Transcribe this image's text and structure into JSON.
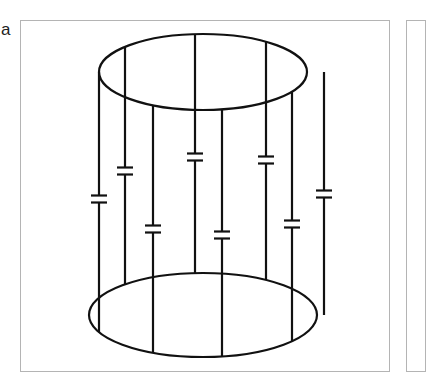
{
  "figure": {
    "panel_label": "a",
    "colors": {
      "stroke": "#111111",
      "frame": "#b4b4b4",
      "background": "#ffffff"
    },
    "top_ring": {
      "cx": 203,
      "cy": 72,
      "rx": 104,
      "ry": 38
    },
    "bottom_ring": {
      "cx": 203,
      "cy": 315,
      "rx": 114,
      "ry": 42
    },
    "rungs": [
      {
        "id": "rung-1",
        "x": 99,
        "capacitor_y": 199
      },
      {
        "id": "rung-2",
        "x": 125,
        "capacitor_y": 171
      },
      {
        "id": "rung-3",
        "x": 153,
        "capacitor_y": 229
      },
      {
        "id": "rung-4",
        "x": 195,
        "capacitor_y": 157
      },
      {
        "id": "rung-5",
        "x": 222,
        "capacitor_y": 235
      },
      {
        "id": "rung-6",
        "x": 266,
        "capacitor_y": 160
      },
      {
        "id": "rung-7",
        "x": 292,
        "capacitor_y": 224
      },
      {
        "id": "rung-8",
        "x": 324,
        "capacitor_y": 194
      }
    ]
  }
}
